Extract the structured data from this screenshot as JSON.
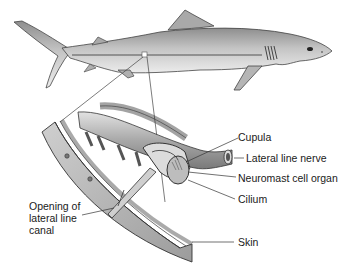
{
  "figure": {
    "labels": {
      "cupula": "Cupula",
      "lateral_line_nerve": "Lateral line nerve",
      "neuromast": "Neuromast cell organ",
      "cilium": "Cilium",
      "opening_line1": "Opening of",
      "opening_line2": "lateral line",
      "opening_line3": "canal",
      "skin": "Skin"
    }
  },
  "colors": {
    "body": "#b8b8b8",
    "body_dark": "#8a8a8a",
    "outline": "#333333",
    "skin_band": "#9a9a9a",
    "background": "#ffffff"
  }
}
